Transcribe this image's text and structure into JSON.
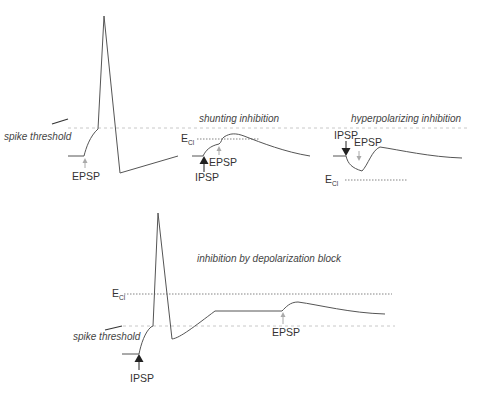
{
  "figure": {
    "type": "neuroscience membrane potential diagram",
    "colors": {
      "trace": "#555555",
      "threshold_line": "#c8c8c8",
      "reversal_line": "#777777",
      "text": "#333333"
    }
  },
  "panels": [
    {
      "id": "excitation",
      "title": "",
      "labels": {
        "threshold": "spike threshold",
        "epsp": "EPSP"
      }
    },
    {
      "id": "shunting",
      "title": "shunting inhibition",
      "labels": {
        "ecl_main": "E",
        "ecl_sub": "Cl",
        "epsp": "EPSP",
        "ipsp": "IPSP"
      }
    },
    {
      "id": "hyperpolarizing",
      "title": "hyperpolarizing inhibition",
      "labels": {
        "ipsp": "IPSP",
        "epsp": "EPSP",
        "ecl_main": "E",
        "ecl_sub": "Cl"
      }
    },
    {
      "id": "depolarization_block",
      "title": "inhibition by depolarization block",
      "labels": {
        "ecl_main": "E",
        "ecl_sub": "Cl",
        "threshold": "spike threshold",
        "ipsp": "IPSP",
        "epsp": "EPSP"
      }
    }
  ]
}
